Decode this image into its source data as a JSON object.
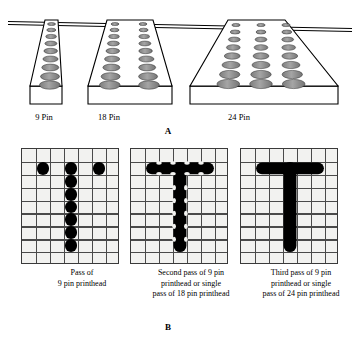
{
  "figure": {
    "panels": [
      {
        "id": "A",
        "marker": "A"
      },
      {
        "id": "B",
        "marker": "B"
      }
    ]
  },
  "panel_a": {
    "marker": "A",
    "title_absent": "",
    "printheads": [
      {
        "label": "9 Pin",
        "pin_count": 9,
        "columns": 1,
        "pins_per_column": 9
      },
      {
        "label": "18 Pin",
        "pin_count": 18,
        "columns": 2,
        "pins_per_column": 9
      },
      {
        "label": "24 Pin",
        "pin_count": 24,
        "columns": 3,
        "pins_per_column": 8
      }
    ],
    "rail_count": 2,
    "colors": {
      "pin_fill": "#8e8e8e",
      "pin_top": "#a8a8a8",
      "body_fill": "#ffffff",
      "outline": "#000000"
    }
  },
  "panel_b": {
    "marker": "B",
    "grid": {
      "columns": 7,
      "rows": 9
    },
    "colors": {
      "cell_fill": "#f2f2f0",
      "grid_line": "#4a4a4a",
      "dot_fill": "#000000"
    },
    "cells": [
      {
        "name": "grid-9-pin",
        "caption": "Pass of\n9 pin printhead",
        "caption_lines": [
          "Pass of",
          "9 pin printhead"
        ],
        "render": "dots",
        "dots": [
          {
            "col": 2,
            "row": 2
          },
          {
            "col": 4,
            "row": 2
          },
          {
            "col": 6,
            "row": 2
          },
          {
            "col": 4,
            "row": 3
          },
          {
            "col": 4,
            "row": 4
          },
          {
            "col": 4,
            "row": 5
          },
          {
            "col": 4,
            "row": 6
          },
          {
            "col": 4,
            "row": 7
          },
          {
            "col": 4,
            "row": 8
          }
        ]
      },
      {
        "name": "grid-18-pin",
        "caption": "Second pass of 9 pin printhead or single pass of 18 pin printhead",
        "caption_lines": [
          "Second pass of 9 pin",
          "printhead or single",
          "pass of 18 pin printhead"
        ],
        "render": "t-rough",
        "letter": "T"
      },
      {
        "name": "grid-24-pin",
        "caption": "Third pass of 9 pin printhead or single pass of 24 pin printhead",
        "caption_lines": [
          "Third pass of 9 pin",
          "printhead or single",
          "pass of 24 pin printhead"
        ],
        "render": "t-smooth",
        "letter": "T"
      }
    ]
  }
}
